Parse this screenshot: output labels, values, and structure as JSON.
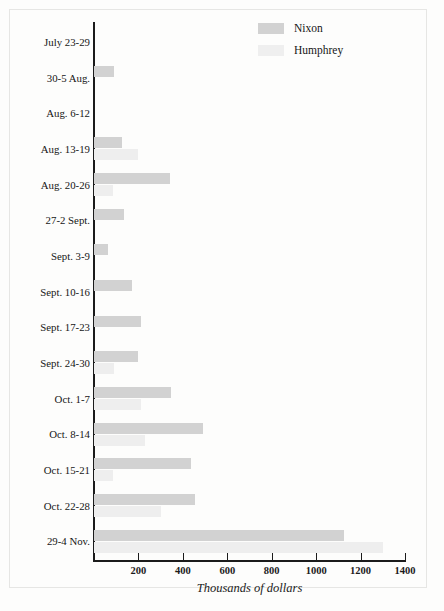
{
  "chart_data": {
    "type": "bar",
    "orientation": "horizontal",
    "title": "",
    "xlabel": "Thousands of dollars",
    "ylabel": "",
    "xlim": [
      0,
      1400
    ],
    "xticks": [
      0,
      200,
      400,
      600,
      800,
      1000,
      1200,
      1400
    ],
    "xtick_labels": [
      "",
      "200",
      "400",
      "600",
      "800",
      "1000",
      "1200",
      "1400"
    ],
    "grid": false,
    "legend_position": "top-right",
    "categories": [
      "July 23-29",
      "30-5 Aug.",
      "Aug. 6-12",
      "Aug. 13-19",
      "Aug. 20-26",
      "27-2 Sept.",
      "Sept. 3-9",
      "Sept. 10-16",
      "Sept. 17-23",
      "Sept. 24-30",
      "Oct. 1-7",
      "Oct. 8-14",
      "Oct. 15-21",
      "Oct. 22-28",
      "29-4 Nov."
    ],
    "series": [
      {
        "name": "Nixon",
        "color": "#d2d2d2",
        "values": [
          0,
          90,
          0,
          125,
          340,
          135,
          65,
          170,
          210,
          200,
          345,
          490,
          435,
          455,
          1125
        ]
      },
      {
        "name": "Humphrey",
        "color": "#efefef",
        "values": [
          0,
          0,
          0,
          200,
          85,
          0,
          0,
          0,
          0,
          90,
          210,
          230,
          85,
          300,
          1300
        ]
      }
    ]
  },
  "legend": {
    "items": [
      {
        "label": "Nixon",
        "swatch": "nixon"
      },
      {
        "label": "Humphrey",
        "swatch": "humphrey"
      }
    ]
  },
  "axis": {
    "x_title": "Thousands of dollars"
  }
}
